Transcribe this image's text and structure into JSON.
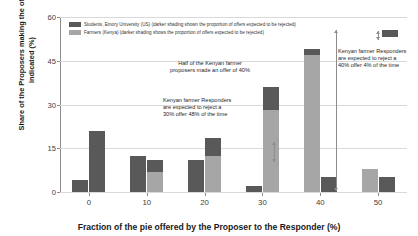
{
  "chart_data": {
    "type": "bar",
    "title": "",
    "xlabel": "Fraction of the pie offered by the Proposer to the Responder (%)",
    "ylabel": "Share of the Proposers making the offer indicated (%)",
    "categories": [
      "0",
      "10",
      "20",
      "30",
      "40",
      "50"
    ],
    "ylim": [
      0,
      60
    ],
    "yticks": [
      "0",
      "15",
      "30",
      "45",
      "60"
    ],
    "grid": true,
    "legend_position": "top-left",
    "series": [
      {
        "name": "Students, Emory University (US) (darker shading shown the proportion of offers expected to be rejected)",
        "key": "students",
        "color": "#595959",
        "values": [
          4,
          12.5,
          11,
          2,
          5,
          5
        ],
        "rejected": [
          4,
          12.5,
          11,
          2,
          5,
          5
        ]
      },
      {
        "name": "Farmers (Kenya) (darker shading shows the proportion of offers expected to be rejected)",
        "key": "farmers",
        "color": "#a6a6a6",
        "reject_color": "#595959",
        "values": [
          21,
          11,
          18.5,
          36,
          49,
          8
        ],
        "rejected": [
          21,
          4,
          6,
          8,
          2,
          0
        ]
      }
    ],
    "annotations": [
      {
        "id": "annot-40offer",
        "text": "Half of the Kenyan farmer\nproposers made an offer of 40%"
      },
      {
        "id": "annot-30reject",
        "text": "Kenyan farmer Responders\nare expected to reject a\n30% offer 48% of the time"
      },
      {
        "id": "annot-40reject",
        "text": "Kenyan farmer Responders\nare expected to reject a\n40% offer 4% of the time"
      }
    ]
  },
  "legend": {
    "items": [
      {
        "swatch": "dark",
        "label": "Students, Emory University (US) (darker shading shown the proportion of offers expected to be rejected)"
      },
      {
        "swatch": "light",
        "label": "Farmers (Kenya) (darker shading shows the proportion of offers expected to be rejected)"
      }
    ]
  },
  "axes": {
    "y_title": "Share of the Proposers making\nthe offer indicated (%)",
    "x_title": "Fraction of the pie offered by the Proposer to the Responder (%)",
    "y_ticks": [
      "60",
      "45",
      "30",
      "15",
      "0"
    ],
    "x_ticks": [
      "0",
      "10",
      "20",
      "30",
      "40",
      "50"
    ]
  }
}
